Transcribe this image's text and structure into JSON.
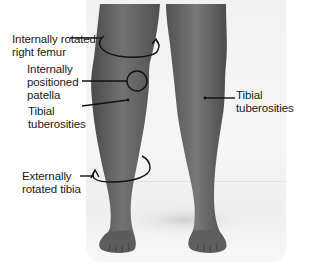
{
  "figure": {
    "labels": {
      "femur": {
        "line1": "Internally rotated",
        "line2": "right femur"
      },
      "patella": {
        "line1": "Internally",
        "line2": "positioned",
        "line3": "patella"
      },
      "tibial_left": {
        "line1": "Tibial",
        "line2": "tuberosities"
      },
      "tibial_right": {
        "line1": "Tibial",
        "line2": "tuberosities"
      },
      "tibia": {
        "line1": "Externally",
        "line2": "rotated tibia"
      }
    },
    "colors": {
      "skin": "#6b6b6b",
      "skin_dark": "#4f4f4f",
      "annotation": "#111111",
      "background": "#f2f2f2"
    }
  }
}
